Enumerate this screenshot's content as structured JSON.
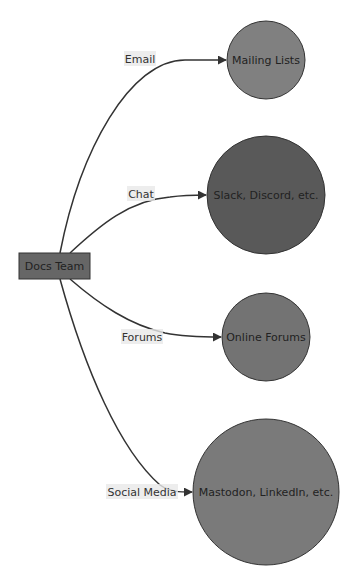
{
  "diagram": {
    "type": "flowchart-LR",
    "source": {
      "id": "docs-team",
      "label": "Docs Team",
      "shape": "rect",
      "fill": "#666666",
      "stroke": "#333333"
    },
    "targets": [
      {
        "id": "mailing-lists",
        "label": "Mailing Lists",
        "shape": "circle",
        "fill": "#808080",
        "stroke": "#333333",
        "edge_label": "Email"
      },
      {
        "id": "slack-discord",
        "label": "Slack, Discord, etc.",
        "shape": "circle",
        "fill": "#595959",
        "stroke": "#333333",
        "edge_label": "Chat"
      },
      {
        "id": "online-forums",
        "label": "Online Forums",
        "shape": "circle",
        "fill": "#737373",
        "stroke": "#333333",
        "edge_label": "Forums"
      },
      {
        "id": "mastodon-linkedin",
        "label": "Mastodon, LinkedIn, etc.",
        "shape": "circle",
        "fill": "#7a7a7a",
        "stroke": "#333333",
        "edge_label": "Social Media"
      }
    ]
  }
}
